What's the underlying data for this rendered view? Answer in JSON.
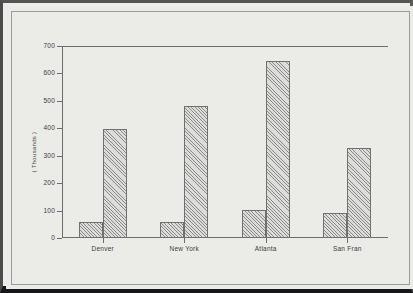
{
  "chart_data": {
    "type": "bar",
    "title": "",
    "subtitle": "",
    "xlabel": "",
    "ylabel": "( Thousands )",
    "ylim": [
      0,
      700
    ],
    "yticks": [
      0,
      100,
      200,
      300,
      400,
      500,
      600,
      700
    ],
    "ytick_labels": [
      "0",
      "100",
      "200",
      "300",
      "400",
      "500",
      "600",
      "700"
    ],
    "grid": false,
    "legend": null,
    "legend_position": "none",
    "categories": [
      "Denver",
      "New York",
      "Atlanta",
      "San Fran"
    ],
    "series": [
      {
        "name": "Series 1",
        "values": [
          58,
          60,
          102,
          91
        ]
      },
      {
        "name": "Series 2",
        "values": [
          396,
          482,
          646,
          328
        ]
      }
    ],
    "annotations": []
  },
  "style": {
    "bar_fill": "#dcdcda",
    "bar_edge": "#707070",
    "axis_color": "#6d6d6b",
    "text_color": "#3b3b3b",
    "paper_background": "#ebebe8",
    "frame_color": "#17171a"
  }
}
